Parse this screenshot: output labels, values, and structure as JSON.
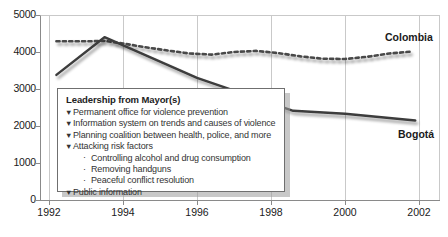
{
  "chart_data": {
    "type": "line",
    "title": "",
    "xlabel": "",
    "ylabel": "",
    "xlim": [
      1992,
      2002.4
    ],
    "ylim": [
      0,
      5000
    ],
    "grid": true,
    "legend_position": "right-inline-labels",
    "x_ticks": [
      "1992",
      "1994",
      "1996",
      "1998",
      "2000",
      "2002"
    ],
    "y_ticks": [
      "0",
      "1000",
      "2000",
      "3000",
      "4000",
      "5000"
    ],
    "series": [
      {
        "name": "Colombia",
        "style": "dashed",
        "color": "#4a4a4a",
        "x": [
          1992.2,
          1992.6,
          1993.0,
          1993.5,
          1994.0,
          1994.6,
          1995.2,
          1995.8,
          1996.4,
          1997.0,
          1997.6,
          1998.2,
          1998.8,
          1999.4,
          2000.0,
          2000.6,
          2001.2,
          2001.8
        ],
        "values": [
          4290,
          4290,
          4290,
          4300,
          4230,
          4130,
          4040,
          3960,
          3930,
          4000,
          4030,
          3970,
          3880,
          3820,
          3810,
          3870,
          3960,
          4010
        ]
      },
      {
        "name": "Bogotá",
        "style": "solid",
        "color": "#3c3c3c",
        "x": [
          1992.2,
          1993.5,
          1996.0,
          1998.6,
          2000.0,
          2001.9
        ],
        "values": [
          3380,
          4400,
          3300,
          2410,
          2330,
          2150
        ]
      }
    ]
  },
  "series_labels": {
    "colombia": "Colombia",
    "bogota": "Bogotá"
  },
  "callout": {
    "title": "Leadership from Mayor(s)",
    "bullet_glyph": "▼",
    "sub_glyph": "·",
    "items": [
      {
        "text": "Permanent office for violence prevention",
        "subitems": []
      },
      {
        "text": "Information system on trends and causes of violence",
        "subitems": []
      },
      {
        "text": "Planning coalition between health, police, and more",
        "subitems": []
      },
      {
        "text": "Attacking risk factors",
        "subitems": [
          "Controlling alcohol and drug consumption",
          "Removing handguns",
          "Peaceful conflict resolution"
        ]
      },
      {
        "text": "Public information",
        "subitems": []
      }
    ]
  },
  "colors": {
    "axis": "#8a8a8a",
    "grid": "#c9c9c9",
    "colombia_line": "#4a4a4a",
    "bogota_line": "#3c3c3c",
    "callout_border": "#6f6f6f",
    "text": "#1a1a1a"
  }
}
